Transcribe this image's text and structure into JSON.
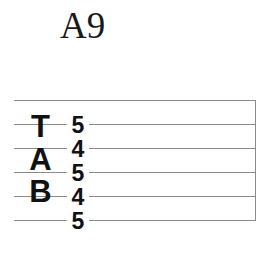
{
  "diagram": {
    "type": "guitar-tablature",
    "chord_name": "A9",
    "background_color": "#ffffff",
    "line_color": "#8a8a8a",
    "text_color": "#111111",
    "clef_letters": [
      "T",
      "A",
      "B"
    ],
    "staff": {
      "string_count": 6,
      "line_spacing_px": 24,
      "has_end_barline": true
    },
    "notes": [
      {
        "string": 1,
        "fret": "5"
      },
      {
        "string": 2,
        "fret": "4"
      },
      {
        "string": 3,
        "fret": "5"
      },
      {
        "string": 4,
        "fret": "4"
      },
      {
        "string": 5,
        "fret": "5"
      },
      {
        "string": 6,
        "fret": ""
      }
    ]
  }
}
